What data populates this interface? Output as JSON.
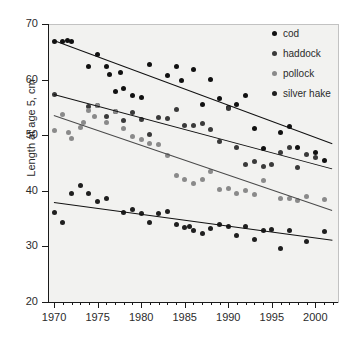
{
  "chart_data": {
    "type": "scatter",
    "title": "",
    "xlabel": "",
    "ylabel": "Length at age 5, cm",
    "xlim": [
      1969.3,
      2002.6
    ],
    "ylim": [
      20,
      70
    ],
    "grid": false,
    "legend_position": "top-right",
    "y_ticks": [
      20,
      30,
      40,
      50,
      60,
      70
    ],
    "x_ticks_major": [
      1970,
      1975,
      1980,
      1985,
      1990,
      1995,
      2000
    ],
    "x_minor_tick_step": 1,
    "colors": {
      "cod": "#111111",
      "haddock": "#3a3a3a",
      "pollock": "#8a8a8a",
      "silver hake": "#1f1f1f",
      "panel_background": "#f2f2f0",
      "figure_background": "#ffffff",
      "axis": "#1a1a1a",
      "text": "#2b2b2b"
    },
    "series": [
      {
        "name": "cod",
        "color": "#111111",
        "trend": {
          "x0": 1970,
          "y0": 67.2,
          "x1": 2002,
          "y1": 48.6
        },
        "points": [
          [
            1970,
            66.9
          ],
          [
            1971,
            66.8
          ],
          [
            1971.5,
            67.0
          ],
          [
            1972,
            66.9
          ],
          [
            1974,
            62.4
          ],
          [
            1975,
            64.6
          ],
          [
            1976,
            62.3
          ],
          [
            1976.4,
            61.0
          ],
          [
            1977,
            57.9
          ],
          [
            1977.6,
            61.3
          ],
          [
            1978,
            58.4
          ],
          [
            1979,
            57.2
          ],
          [
            1980,
            56.7
          ],
          [
            1981,
            62.7
          ],
          [
            1983,
            60.8
          ],
          [
            1984,
            62.4
          ],
          [
            1984.6,
            59.8
          ],
          [
            1986,
            61.8
          ],
          [
            1988,
            60.0
          ],
          [
            1989,
            56.6
          ],
          [
            1990,
            54.9
          ],
          [
            1991,
            55.5
          ],
          [
            1992,
            57.1
          ],
          [
            1994,
            47.6
          ],
          [
            1996,
            50.4
          ],
          [
            1997,
            51.5
          ],
          [
            1998,
            47.7
          ],
          [
            2000,
            46.8
          ],
          [
            2001,
            45.4
          ],
          [
            1987,
            55.6
          ],
          [
            1993,
            51.2
          ]
        ]
      },
      {
        "name": "haddock",
        "color": "#3a3a3a",
        "trend": {
          "x0": 1970,
          "y0": 57.4,
          "x1": 2002,
          "y1": 44.0
        },
        "points": [
          [
            1970,
            57.4
          ],
          [
            1974,
            55.1
          ],
          [
            1975,
            55.3
          ],
          [
            1976,
            53.3
          ],
          [
            1977,
            54.2
          ],
          [
            1978,
            52.6
          ],
          [
            1979,
            54.1
          ],
          [
            1980,
            52.9
          ],
          [
            1981,
            50.2
          ],
          [
            1982,
            53.2
          ],
          [
            1983,
            53.0
          ],
          [
            1984,
            54.6
          ],
          [
            1985,
            51.8
          ],
          [
            1986,
            51.7
          ],
          [
            1987,
            52.1
          ],
          [
            1988,
            51.1
          ],
          [
            1989,
            48.9
          ],
          [
            1991,
            47.7
          ],
          [
            1992,
            44.8
          ],
          [
            1993,
            45.3
          ],
          [
            1994,
            44.4
          ],
          [
            1995,
            44.7
          ],
          [
            1996,
            46.9
          ],
          [
            1997,
            47.7
          ],
          [
            1998,
            44.2
          ],
          [
            2000,
            45.9
          ],
          [
            1990,
            54.8
          ],
          [
            1999,
            46.5
          ]
        ]
      },
      {
        "name": "pollock",
        "color": "#8a8a8a",
        "trend": {
          "x0": 1970,
          "y0": 53.6,
          "x1": 2002,
          "y1": 36.5
        },
        "points": [
          [
            1970,
            50.8
          ],
          [
            1971,
            53.8
          ],
          [
            1971.6,
            50.5
          ],
          [
            1972,
            49.4
          ],
          [
            1973,
            51.3
          ],
          [
            1973.4,
            52.2
          ],
          [
            1974,
            54.5
          ],
          [
            1974.6,
            53.4
          ],
          [
            1975,
            55.3
          ],
          [
            1976,
            52.3
          ],
          [
            1977,
            54.2
          ],
          [
            1978,
            51.2
          ],
          [
            1979,
            49.7
          ],
          [
            1980,
            49.3
          ],
          [
            1981,
            48.5
          ],
          [
            1982,
            48.3
          ],
          [
            1983,
            46.3
          ],
          [
            1984,
            42.7
          ],
          [
            1985,
            42.0
          ],
          [
            1986,
            41.3
          ],
          [
            1987,
            42.0
          ],
          [
            1988,
            43.5
          ],
          [
            1989,
            40.3
          ],
          [
            1990,
            40.4
          ],
          [
            1991,
            39.5
          ],
          [
            1992,
            40.1
          ],
          [
            1993,
            39.3
          ],
          [
            1994,
            41.8
          ],
          [
            1996,
            38.7
          ],
          [
            1997,
            38.6
          ],
          [
            1998,
            38.2
          ],
          [
            1999,
            39.0
          ],
          [
            2001,
            38.4
          ]
        ]
      },
      {
        "name": "silver hake",
        "color": "#1f1f1f",
        "trend": {
          "x0": 1970,
          "y0": 38.0,
          "x1": 2002,
          "y1": 31.2
        },
        "points": [
          [
            1970,
            36.1
          ],
          [
            1971,
            34.3
          ],
          [
            1972,
            39.5
          ],
          [
            1973,
            41.0
          ],
          [
            1974,
            39.5
          ],
          [
            1975,
            38.0
          ],
          [
            1976,
            38.7
          ],
          [
            1978,
            36.1
          ],
          [
            1979,
            36.6
          ],
          [
            1980,
            36.0
          ],
          [
            1981,
            34.3
          ],
          [
            1982,
            35.9
          ],
          [
            1983,
            36.3
          ],
          [
            1984,
            33.9
          ],
          [
            1985,
            33.4
          ],
          [
            1985.6,
            33.6
          ],
          [
            1986,
            32.9
          ],
          [
            1987,
            32.3
          ],
          [
            1988,
            33.2
          ],
          [
            1989,
            34.0
          ],
          [
            1990,
            33.5
          ],
          [
            1991,
            32.0
          ],
          [
            1992,
            33.5
          ],
          [
            1993,
            31.2
          ],
          [
            1994,
            32.9
          ],
          [
            1996,
            29.6
          ],
          [
            1997,
            32.8
          ],
          [
            1999,
            30.8
          ],
          [
            2001,
            32.7
          ],
          [
            1995,
            33.1
          ]
        ]
      }
    ]
  },
  "legend": {
    "items": [
      {
        "label": "cod",
        "color": "#111111"
      },
      {
        "label": "haddock",
        "color": "#3a3a3a"
      },
      {
        "label": "pollock",
        "color": "#8a8a8a"
      },
      {
        "label": "silver hake",
        "color": "#1f1f1f"
      }
    ]
  }
}
